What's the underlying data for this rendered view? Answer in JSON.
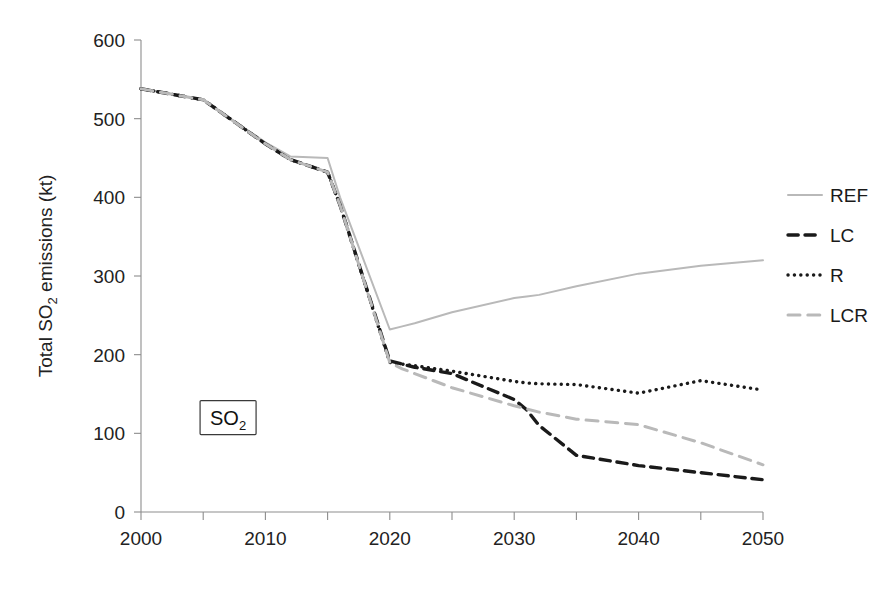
{
  "chart_data": {
    "type": "line",
    "title": "",
    "xlabel": "",
    "ylabel": "Total SO2 emissions (kt)",
    "ylabel_parts": {
      "pre": "Total SO",
      "sub": "2",
      "post": " emissions (kt)"
    },
    "xlim": [
      2000,
      2050
    ],
    "ylim": [
      0,
      600
    ],
    "ytick_step": 100,
    "xtick_step": 5,
    "xlabel_step": 10,
    "grid": false,
    "legend_position": "right",
    "xticks": [
      2000,
      2005,
      2010,
      2015,
      2020,
      2025,
      2030,
      2035,
      2040,
      2045,
      2050
    ],
    "xtick_labels": [
      "2000",
      "",
      "2010",
      "",
      "2020",
      "",
      "2030",
      "",
      "2040",
      "",
      "2050"
    ],
    "yticks": [
      0,
      100,
      200,
      300,
      400,
      500,
      600
    ],
    "ytick_labels": [
      "0",
      "100",
      "200",
      "300",
      "400",
      "500",
      "600"
    ],
    "annotation": {
      "text": "SO2",
      "text_pre": "SO",
      "text_sub": "2",
      "x": 2007,
      "y": 120
    },
    "x": [
      2000,
      2005,
      2010,
      2012,
      2015,
      2016,
      2020,
      2021,
      2022,
      2025,
      2030,
      2031,
      2032,
      2035,
      2040,
      2045,
      2050
    ],
    "series": [
      {
        "name": "REF",
        "color": "#b9b9b9",
        "dash": "none",
        "width": 2.0,
        "values": [
          538,
          524,
          470,
          452,
          450,
          400,
          232,
          236,
          240,
          254,
          272,
          274,
          276,
          287,
          303,
          313,
          320
        ]
      },
      {
        "name": "LC",
        "color": "#1a1a1a",
        "dash": "dashed",
        "width": 3.4,
        "values": [
          538,
          524,
          468,
          448,
          432,
          390,
          192,
          188,
          184,
          176,
          143,
          130,
          110,
          72,
          59,
          50,
          41
        ]
      },
      {
        "name": "R",
        "color": "#1a1a1a",
        "dash": "dotted",
        "width": 3.4,
        "values": [
          538,
          524,
          468,
          448,
          432,
          390,
          190,
          188,
          186,
          179,
          166,
          164,
          163,
          162,
          151,
          167,
          155
        ]
      },
      {
        "name": "LCR",
        "color": "#b9b9b9",
        "dash": "longdash",
        "width": 3.0,
        "values": [
          538,
          524,
          468,
          448,
          432,
          390,
          190,
          182,
          176,
          158,
          135,
          131,
          127,
          118,
          111,
          88,
          60
        ]
      }
    ]
  },
  "legend": {
    "items": [
      {
        "label": "REF",
        "color": "#b9b9b9",
        "dash": "none"
      },
      {
        "label": "LC",
        "color": "#1a1a1a",
        "dash": "dashed"
      },
      {
        "label": "R",
        "color": "#1a1a1a",
        "dash": "dotted"
      },
      {
        "label": "LCR",
        "color": "#b9b9b9",
        "dash": "longdash"
      }
    ]
  }
}
